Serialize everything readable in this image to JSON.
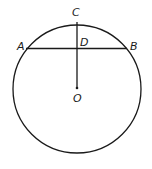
{
  "diagram": {
    "type": "circle-chord-geometry",
    "circle": {
      "cx": 77,
      "cy": 89,
      "r": 64
    },
    "points": {
      "A": {
        "label": "A",
        "x": 26,
        "y": 48
      },
      "B": {
        "label": "B",
        "x": 127,
        "y": 48
      },
      "C": {
        "label": "C",
        "x": 77,
        "y": 22
      },
      "D": {
        "label": "D",
        "x": 77,
        "y": 48
      },
      "O": {
        "label": "O",
        "x": 77,
        "y": 88
      }
    },
    "segments": [
      {
        "from": "A",
        "to": "B",
        "name": "chord-AB"
      },
      {
        "from": "C",
        "to": "O",
        "name": "segment-CO"
      }
    ],
    "stroke_color": "#1a1a1a"
  }
}
